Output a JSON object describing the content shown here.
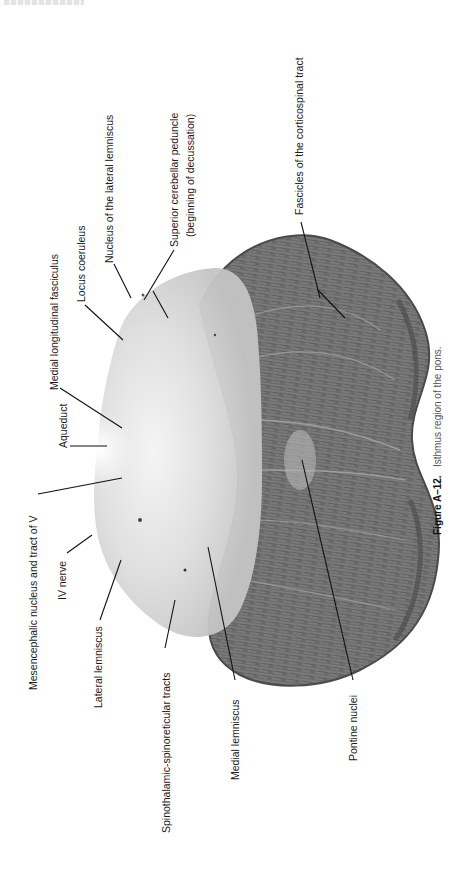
{
  "page": {
    "header_clipped": true
  },
  "figure": {
    "number_label": "Figure  A–12.",
    "caption": "Isthmus region of the pons.",
    "orientation": "rotated 90° counter-clockwise"
  },
  "labels": {
    "mesencephalic": "Mesencephalic nucleus and tract of V",
    "iv_nerve": "IV nerve",
    "lateral_lemniscus": "Lateral lemniscus",
    "spinothalamic": "Spinothalamic-spinoreticular tracts",
    "medial_lemniscus": "Medial lemniscus",
    "pontine_nuclei": "Pontine nuclei",
    "aqueduct": "Aqueduct",
    "mlf": "Medial longitudinal fasciculus",
    "locus_coeruleus": "Locus coeruleus",
    "nucleus_lateral_lemniscus": "Nucleus of the lateral lemniscus",
    "superior_cerebellar_peduncle_1": "Superior cerebellar peduncle",
    "superior_cerebellar_peduncle_2": "(beginning of decussation)",
    "fascicles": "Fascicles of the corticospinal tract"
  },
  "colors": {
    "background": "#ffffff",
    "tegmentum": "#d9d9d9",
    "basis_pontis": "#6e6e6e",
    "text": "#1a1a1a"
  }
}
